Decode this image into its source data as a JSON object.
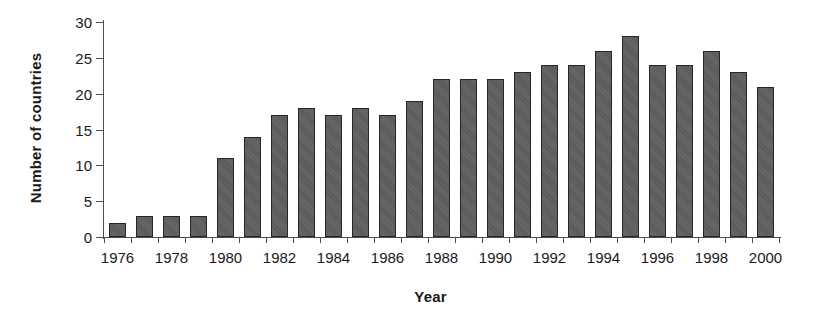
{
  "chart_data": {
    "type": "bar",
    "title": "",
    "xlabel": "Year",
    "ylabel": "Number of countries",
    "categories": [
      "1976",
      "1977",
      "1978",
      "1979",
      "1980",
      "1981",
      "1982",
      "1983",
      "1984",
      "1985",
      "1986",
      "1987",
      "1988",
      "1989",
      "1990",
      "1991",
      "1992",
      "1993",
      "1994",
      "1995",
      "1996",
      "1997",
      "1998",
      "1999",
      "2000"
    ],
    "values": [
      2,
      3,
      3,
      3,
      11,
      14,
      17,
      18,
      17,
      18,
      17,
      19,
      22,
      22,
      22,
      23,
      24,
      24,
      26,
      28,
      24,
      24,
      26,
      23,
      21
    ],
    "ylim": [
      0,
      30
    ],
    "ytick_labels": [
      "0",
      "5",
      "10",
      "15",
      "20",
      "25",
      "30"
    ],
    "ytick_values": [
      0,
      5,
      10,
      15,
      20,
      25,
      30
    ],
    "xtick_labels": [
      "1976",
      "1978",
      "1980",
      "1982",
      "1984",
      "1986",
      "1988",
      "1990",
      "1992",
      "1994",
      "1996",
      "1998",
      "2000"
    ],
    "grid": false,
    "legend": null,
    "bar_color": "#585858",
    "bar_edge_color": "#262626",
    "axis_color": "#4d4d4d",
    "text_color": "#1a1a1a"
  }
}
